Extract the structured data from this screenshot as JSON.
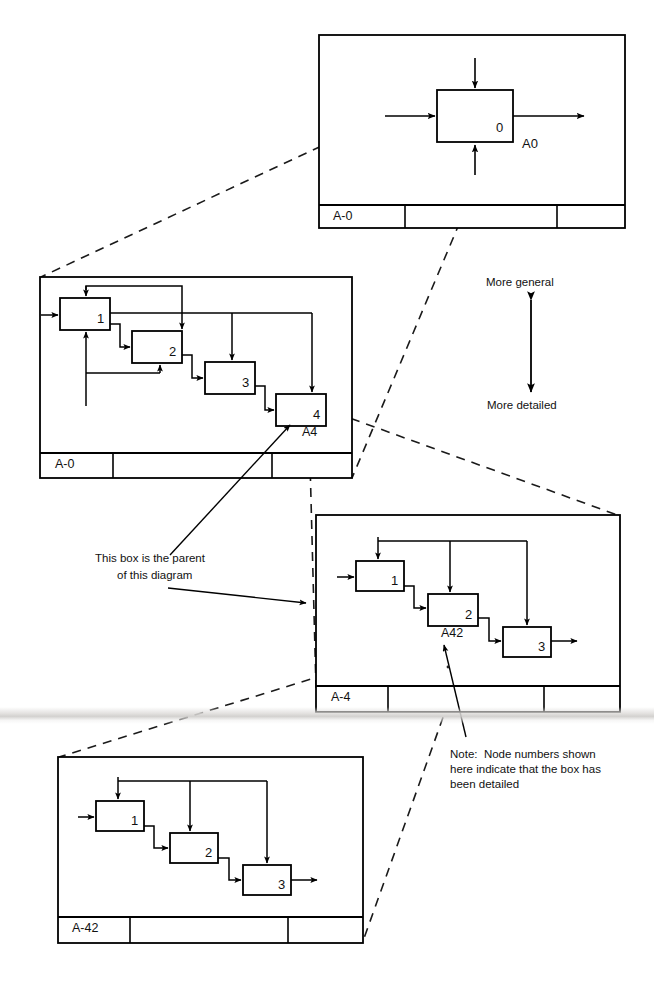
{
  "document": {
    "title": "IDEF0 Decomposition Hierarchy",
    "type": "diagram",
    "background_color": "#ffffff",
    "line_color": "#000000"
  },
  "annotations": {
    "more_general": "More general",
    "more_detailed": "More detailed",
    "parent_note_line1": "This box is the parent",
    "parent_note_line2": "of this diagram",
    "node_note_line1": "Note:  Node numbers shown",
    "node_note_line2": "here indicate that the box has",
    "node_note_line3": "been detailed"
  },
  "diagrams": [
    {
      "id": "ctx",
      "node_label": "A-0",
      "title_block_label": "A-0",
      "boxes": [
        {
          "number": "0",
          "detail_ref": "A0"
        }
      ]
    },
    {
      "id": "a0",
      "node_label": "A-0",
      "title_block_label": "A-0",
      "boxes": [
        {
          "number": "1",
          "detail_ref": ""
        },
        {
          "number": "2",
          "detail_ref": ""
        },
        {
          "number": "3",
          "detail_ref": ""
        },
        {
          "number": "4",
          "detail_ref": "A4"
        }
      ]
    },
    {
      "id": "a4",
      "node_label": "A-4",
      "title_block_label": "A-4",
      "boxes": [
        {
          "number": "1",
          "detail_ref": ""
        },
        {
          "number": "2",
          "detail_ref": "A42"
        },
        {
          "number": "3",
          "detail_ref": ""
        }
      ]
    },
    {
      "id": "a42",
      "node_label": "A-42",
      "title_block_label": "A-42",
      "boxes": [
        {
          "number": "1",
          "detail_ref": ""
        },
        {
          "number": "2",
          "detail_ref": ""
        },
        {
          "number": "3",
          "detail_ref": ""
        }
      ]
    }
  ],
  "labels": {
    "ctx_box_0": "0",
    "ctx_ref_a0": "A0",
    "ctx_title_a0": "A-0",
    "a0_box_1": "1",
    "a0_box_2": "2",
    "a0_box_3": "3",
    "a0_box_4": "4",
    "a0_ref_a4": "A4",
    "a0_title_a0": "A-0",
    "a4_box_1": "1",
    "a4_box_2": "2",
    "a4_box_3": "3",
    "a4_ref_a42": "A42",
    "a4_title_a4": "A-4",
    "a42_box_1": "1",
    "a42_box_2": "2",
    "a42_box_3": "3",
    "a42_title_a42": "A-42"
  }
}
